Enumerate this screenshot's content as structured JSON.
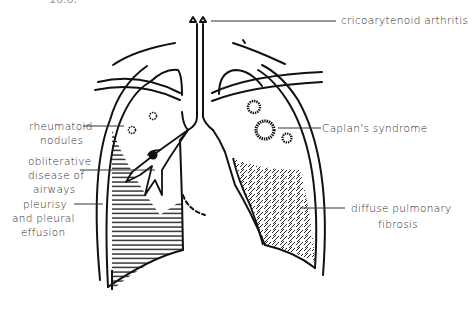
{
  "figure": {
    "cropped_caption": "16.6.",
    "labels": {
      "cricoarytenoid": "cricoarytenoid  arthritis",
      "rheumatoid_1": "rheumatoid",
      "rheumatoid_2": "nodules",
      "obliterative_1": "obliterative",
      "obliterative_2": "disease of",
      "obliterative_3": "airways",
      "pleurisy_1": "pleurisy",
      "pleurisy_2": "and pleural",
      "pleurisy_3": "effusion",
      "caplan": "Caplan's  syndrome",
      "fibrosis_1": "diffuse pulmonary",
      "fibrosis_2": "fibrosis"
    }
  }
}
